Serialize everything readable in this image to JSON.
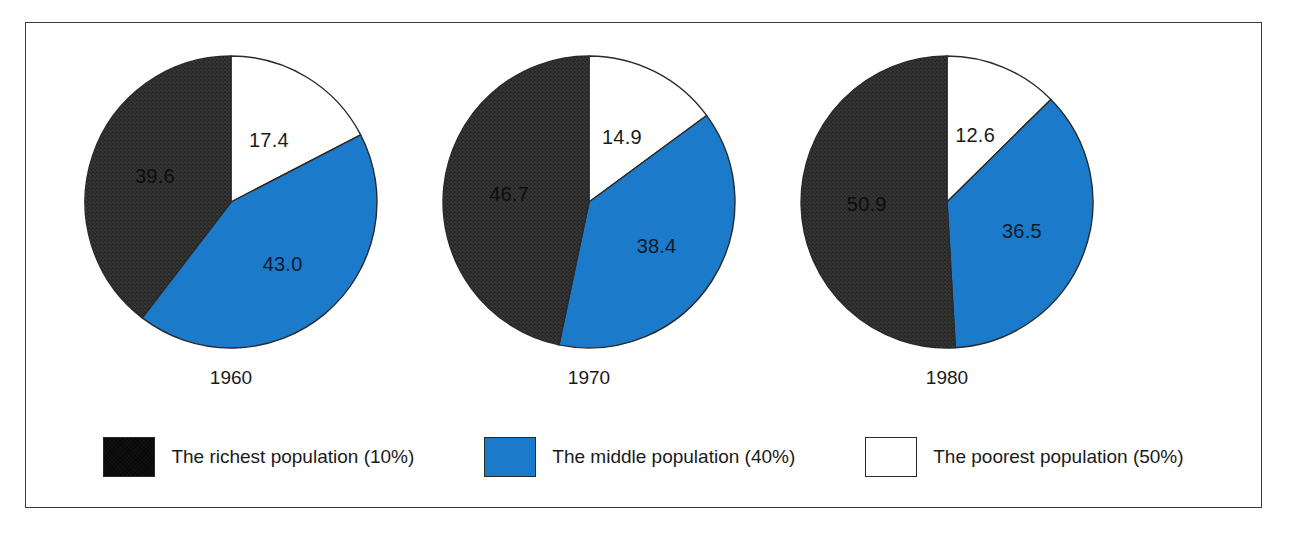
{
  "chart_data": {
    "type": "pie",
    "title": "",
    "subtitle": "",
    "xlabel": "",
    "ylabel": "",
    "grid": false,
    "legend_position": "bottom",
    "categories": [
      "The richest population (10%)",
      "The middle population (40%)",
      "The poorest population (50%)"
    ],
    "series": [
      {
        "name": "1960",
        "values": [
          39.6,
          43.0,
          17.4
        ]
      },
      {
        "name": "1970",
        "values": [
          46.7,
          38.4,
          14.9
        ]
      },
      {
        "name": "1980",
        "values": [
          50.9,
          36.5,
          12.6
        ]
      }
    ],
    "charts": [
      {
        "year": "1960",
        "slices": [
          {
            "key": "poorest",
            "label": "17.4",
            "value": 17.4,
            "color": "#ffffff",
            "text_tone": "on-white"
          },
          {
            "key": "middle",
            "label": "43.0",
            "value": 43.0,
            "color": "#1b7ac9",
            "text_tone": "on-blue"
          },
          {
            "key": "richest",
            "label": "39.6",
            "value": 39.6,
            "color": "#3a3a3a",
            "text_tone": "on-dark"
          }
        ]
      },
      {
        "year": "1970",
        "slices": [
          {
            "key": "poorest",
            "label": "14.9",
            "value": 14.9,
            "color": "#ffffff",
            "text_tone": "on-white"
          },
          {
            "key": "middle",
            "label": "38.4",
            "value": 38.4,
            "color": "#1b7ac9",
            "text_tone": "on-blue"
          },
          {
            "key": "richest",
            "label": "46.7",
            "value": 46.7,
            "color": "#3a3a3a",
            "text_tone": "on-dark"
          }
        ]
      },
      {
        "year": "1980",
        "slices": [
          {
            "key": "poorest",
            "label": "12.6",
            "value": 12.6,
            "color": "#ffffff",
            "text_tone": "on-white"
          },
          {
            "key": "middle",
            "label": "36.5",
            "value": 36.5,
            "color": "#1b7ac9",
            "text_tone": "on-blue"
          },
          {
            "key": "richest",
            "label": "50.9",
            "value": 50.9,
            "color": "#3a3a3a",
            "text_tone": "on-dark"
          }
        ]
      }
    ]
  },
  "legend": {
    "items": [
      {
        "label": "The richest population (10%)",
        "color": "#3a3a3a",
        "pattern": "crosshatch",
        "swatch_name": "legend-swatch-richest"
      },
      {
        "label": "The middle population (40%)",
        "color": "#1b7ac9",
        "pattern": "solid",
        "swatch_name": "legend-swatch-middle"
      },
      {
        "label": "The poorest population (50%)",
        "color": "#ffffff",
        "pattern": "solid",
        "swatch_name": "legend-swatch-poorest"
      }
    ]
  },
  "colors": {
    "richest": "#3a3a3a",
    "middle": "#1b7ac9",
    "poorest": "#ffffff",
    "outline": "#2a2a2a",
    "frame": "#3b3b3b",
    "background": "#ffffff"
  }
}
